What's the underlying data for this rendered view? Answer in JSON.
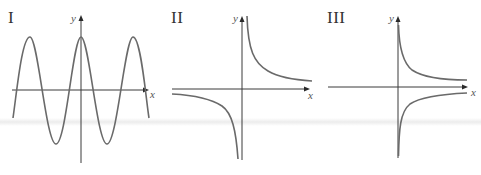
{
  "figure": {
    "panels": [
      {
        "id": "I",
        "numeral": "I",
        "x_label": "x",
        "y_label": "y",
        "curve_type": "cosine",
        "description": "periodic cosine-like wave crossing the axes, peak on the y-axis"
      },
      {
        "id": "II",
        "numeral": "II",
        "x_label": "x",
        "y_label": "y",
        "curve_type": "reciprocal",
        "description": "hyperbola y = k/x with branches in quadrants I and III"
      },
      {
        "id": "III",
        "numeral": "III",
        "x_label": "x",
        "y_label": "y",
        "curve_type": "reciprocal-variant",
        "description": "two branches on right of y-axis: one above x-axis, one below, both approaching x-axis"
      }
    ],
    "colors": {
      "axis": "#3a3a3a",
      "curve": "#6a6a6a",
      "text": "#333333"
    }
  }
}
